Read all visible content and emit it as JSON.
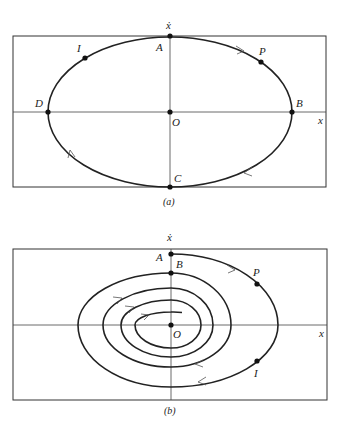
{
  "panel_a": {
    "caption": "(a)",
    "y_axis_label": "ẋ",
    "x_axis_label": "x",
    "points": {
      "A": "A",
      "B": "B",
      "C": "C",
      "D": "D",
      "O": "O",
      "P": "P",
      "I": "I"
    },
    "description": "Closed elliptical phase trajectory (undamped oscillation), clockwise"
  },
  "panel_b": {
    "caption": "(b)",
    "y_axis_label": "ẋ",
    "x_axis_label": "x",
    "points": {
      "A": "A",
      "B": "B",
      "O": "O",
      "P": "P",
      "I": "I"
    },
    "description": "Inward spiral phase trajectory (damped oscillation) converging to origin O, clockwise"
  },
  "colors": {
    "background": "#ffffff",
    "ink": "#222222"
  }
}
